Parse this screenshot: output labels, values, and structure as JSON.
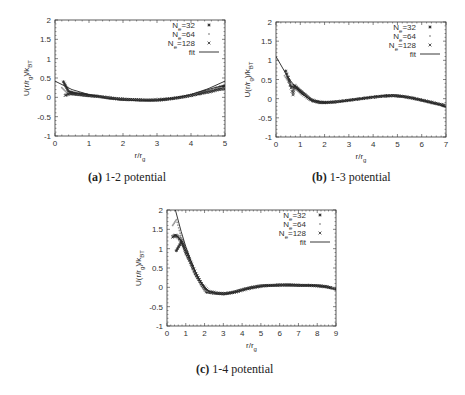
{
  "chart_data": [
    {
      "id": "a",
      "type": "scatter",
      "caption_letter": "(a)",
      "caption_text": "1-2 potential",
      "xlabel": "r/r_g",
      "ylabel": "U(r/r_g)/k_BT",
      "xlim": [
        0,
        5
      ],
      "ylim": [
        -1,
        2
      ],
      "xticks": [
        0,
        1,
        2,
        3,
        4,
        5
      ],
      "yticks": [
        -1,
        -0.5,
        0,
        0.5,
        1,
        1.5,
        2
      ],
      "yticklabels": [
        "-1",
        "-0.5",
        "0",
        "0.5",
        "1",
        "1.5",
        "2"
      ],
      "grid": false,
      "legend_position": "upper right",
      "legend": [
        "N_e=32",
        "N_e=64",
        "N_e=128",
        "fit"
      ],
      "frame": {
        "left": 55,
        "right": 225,
        "top": 20,
        "bottom": 136
      },
      "series": [
        {
          "name": "N_e=32",
          "marker": "*",
          "x": [
            0.25,
            0.4,
            0.6,
            0.8,
            1.0,
            1.3,
            1.6,
            1.9,
            2.2,
            2.5,
            2.8,
            3.1,
            3.4,
            3.7,
            4.0,
            4.2,
            4.4,
            4.6,
            4.8,
            5.0
          ],
          "y": [
            0.4,
            0.15,
            0.1,
            0.08,
            0.05,
            0.02,
            -0.02,
            -0.05,
            -0.06,
            -0.07,
            -0.08,
            -0.07,
            -0.04,
            0.0,
            0.05,
            0.1,
            0.15,
            0.2,
            0.25,
            0.3
          ]
        },
        {
          "name": "N_e=64",
          "marker": ".",
          "x": [
            0.2,
            0.35,
            0.5,
            0.7,
            0.9,
            1.2,
            1.5,
            1.8,
            2.1,
            2.4,
            2.7,
            3.0,
            3.3,
            3.6,
            3.9,
            4.1,
            4.3,
            4.5,
            4.7,
            4.9
          ],
          "y": [
            0.25,
            0.12,
            0.08,
            0.06,
            0.04,
            0.02,
            -0.01,
            -0.04,
            -0.06,
            -0.07,
            -0.07,
            -0.06,
            -0.04,
            -0.01,
            0.03,
            0.08,
            0.12,
            0.17,
            0.22,
            0.25
          ]
        },
        {
          "name": "N_e=128",
          "marker": "x",
          "x": [
            0.3,
            0.45,
            0.6,
            0.8,
            1.0,
            1.2,
            1.5,
            1.8,
            2.1,
            2.4,
            2.7,
            3.0,
            3.3,
            3.6,
            3.9,
            4.2,
            4.4,
            4.6,
            4.8,
            5.0
          ],
          "y": [
            0.05,
            0.1,
            0.08,
            0.06,
            0.04,
            0.03,
            0.0,
            -0.03,
            -0.05,
            -0.06,
            -0.07,
            -0.06,
            -0.04,
            -0.01,
            0.03,
            0.08,
            0.12,
            0.15,
            0.2,
            0.22
          ]
        },
        {
          "name": "fit",
          "marker": "line",
          "x": [
            0,
            0.5,
            1.0,
            1.5,
            2.0,
            2.5,
            3.0,
            3.5,
            4.0,
            4.5,
            5.0
          ],
          "y": [
            0.42,
            0.2,
            0.07,
            -0.02,
            -0.07,
            -0.09,
            -0.07,
            -0.02,
            0.07,
            0.22,
            0.42
          ]
        }
      ]
    },
    {
      "id": "b",
      "type": "scatter",
      "caption_letter": "(b)",
      "caption_text": "1-3 potential",
      "xlabel": "r/r_g",
      "ylabel": "U(r/r_g)/k_BT",
      "xlim": [
        0,
        7
      ],
      "ylim": [
        -1,
        2
      ],
      "xticks": [
        0,
        1,
        2,
        3,
        4,
        5,
        6,
        7
      ],
      "yticks": [
        -1,
        -0.5,
        0,
        0.5,
        1,
        1.5,
        2
      ],
      "yticklabels": [
        "-1",
        "-0.5",
        "0",
        "0.5",
        "1",
        "1.5",
        "2"
      ],
      "grid": false,
      "legend_position": "upper right",
      "legend": [
        "N_e=32",
        "N_e=64",
        "N_e=128",
        "fit"
      ],
      "frame": {
        "left": 276,
        "right": 446,
        "top": 22,
        "bottom": 137
      },
      "series": [
        {
          "name": "N_e=32",
          "marker": "*",
          "x": [
            0.4,
            0.6,
            0.8,
            1.0,
            1.2,
            1.5,
            1.8,
            2.1,
            2.5,
            3.0,
            3.5,
            4.0,
            4.5,
            4.8,
            5.2,
            5.6,
            6.0,
            6.4,
            6.8,
            7.0
          ],
          "y": [
            0.72,
            0.35,
            0.3,
            0.2,
            0.1,
            -0.05,
            -0.1,
            -0.1,
            -0.08,
            -0.04,
            0.0,
            0.04,
            0.07,
            0.08,
            0.06,
            0.02,
            -0.04,
            -0.1,
            -0.16,
            -0.2
          ]
        },
        {
          "name": "N_e=64",
          "marker": ".",
          "x": [
            0.35,
            0.55,
            0.75,
            0.95,
            1.2,
            1.5,
            1.8,
            2.2,
            2.6,
            3.1,
            3.6,
            4.1,
            4.6,
            5.0,
            5.4,
            5.8,
            6.2,
            6.6,
            7.0
          ],
          "y": [
            0.6,
            0.4,
            0.32,
            0.2,
            0.08,
            -0.04,
            -0.09,
            -0.1,
            -0.08,
            -0.04,
            0.0,
            0.05,
            0.08,
            0.07,
            0.04,
            -0.01,
            -0.06,
            -0.13,
            -0.18
          ]
        },
        {
          "name": "N_e=128",
          "marker": "x",
          "x": [
            0.5,
            0.7,
            0.75,
            0.9,
            1.1,
            1.4,
            1.7,
            2.0,
            2.4,
            2.9,
            3.4,
            3.9,
            4.4,
            4.9,
            5.3,
            5.7,
            6.1,
            6.5,
            6.9
          ],
          "y": [
            0.55,
            0.1,
            0.35,
            0.25,
            0.12,
            -0.02,
            -0.08,
            -0.1,
            -0.09,
            -0.05,
            -0.01,
            0.03,
            0.07,
            0.08,
            0.05,
            0.0,
            -0.05,
            -0.11,
            -0.17
          ]
        },
        {
          "name": "fit",
          "marker": "line",
          "x": [
            0,
            0.5,
            1.0,
            1.5,
            2.0,
            2.5,
            3.0,
            3.5,
            4.0,
            4.5,
            5.0,
            5.5,
            6.0,
            6.5,
            7.0
          ],
          "y": [
            1.1,
            0.55,
            0.15,
            -0.05,
            -0.1,
            -0.09,
            -0.05,
            0.0,
            0.05,
            0.08,
            0.07,
            0.03,
            -0.04,
            -0.12,
            -0.2
          ]
        }
      ]
    },
    {
      "id": "c",
      "type": "scatter",
      "caption_letter": "(c)",
      "caption_text": "1-4 potential",
      "xlabel": "r/r_g",
      "ylabel": "U(r/r_g)/k_BT",
      "xlim": [
        0,
        9
      ],
      "ylim": [
        -1,
        2
      ],
      "xticks": [
        0,
        1,
        2,
        3,
        4,
        5,
        6,
        7,
        8,
        9
      ],
      "yticks": [
        -1,
        -0.5,
        0,
        0.5,
        1,
        1.5,
        2
      ],
      "yticklabels": [
        "-1",
        "-0.5",
        "0",
        "0.5",
        "1",
        "1.5",
        "2"
      ],
      "grid": false,
      "legend_position": "upper right",
      "legend": [
        "N_e=32",
        "N_e=64",
        "N_e=128",
        "fit"
      ],
      "frame": {
        "left": 167,
        "right": 336,
        "top": 210,
        "bottom": 326
      },
      "series": [
        {
          "name": "N_e=32",
          "marker": "*",
          "x": [
            0.5,
            0.8,
            1.0,
            1.2,
            1.5,
            1.8,
            2.1,
            2.5,
            3.0,
            3.5,
            4.0,
            4.5,
            5.0,
            5.5,
            6.0,
            6.5,
            7.0,
            7.5,
            8.0,
            8.5,
            9.0
          ],
          "y": [
            0.95,
            1.2,
            0.9,
            0.7,
            0.35,
            0.1,
            -0.12,
            -0.15,
            -0.17,
            -0.13,
            -0.06,
            0.0,
            0.04,
            0.05,
            0.06,
            0.06,
            0.05,
            0.05,
            0.04,
            0.02,
            -0.05
          ]
        },
        {
          "name": "N_e=64",
          "marker": ".",
          "x": [
            0.3,
            0.5,
            0.7,
            0.9,
            1.1,
            1.4,
            1.7,
            2.0,
            2.4,
            2.9,
            3.4,
            3.9,
            4.4,
            4.9,
            5.4,
            5.9,
            6.4,
            6.9,
            7.4,
            7.9,
            8.4,
            8.9
          ],
          "y": [
            1.6,
            1.75,
            1.4,
            1.1,
            0.8,
            0.45,
            0.15,
            -0.08,
            -0.14,
            -0.17,
            -0.15,
            -0.08,
            -0.02,
            0.03,
            0.05,
            0.06,
            0.06,
            0.05,
            0.05,
            0.04,
            0.02,
            -0.03
          ]
        },
        {
          "name": "N_e=128",
          "marker": "x",
          "x": [
            0.3,
            0.45,
            0.6,
            0.75,
            0.9,
            1.1,
            1.3,
            1.6,
            1.9,
            2.2,
            2.7,
            3.2,
            3.7,
            4.2,
            4.7,
            5.2,
            5.7,
            6.2,
            6.7,
            7.2,
            7.7,
            8.2,
            8.7
          ],
          "y": [
            1.3,
            1.35,
            1.3,
            1.2,
            1.05,
            0.85,
            0.6,
            0.3,
            0.05,
            -0.1,
            -0.15,
            -0.16,
            -0.12,
            -0.05,
            0.0,
            0.04,
            0.05,
            0.06,
            0.06,
            0.05,
            0.05,
            0.03,
            -0.01
          ]
        },
        {
          "name": "fit",
          "marker": "line",
          "x": [
            0.45,
            0.75,
            1.0,
            1.25,
            1.5,
            1.75,
            2.0,
            2.3,
            2.7,
            3.0,
            3.5,
            4.0,
            4.5,
            5.0,
            5.5,
            6.0,
            6.5,
            7.0,
            7.5,
            8.0,
            8.5,
            9.0
          ],
          "y": [
            2.0,
            1.45,
            1.05,
            0.72,
            0.42,
            0.18,
            0.0,
            -0.12,
            -0.17,
            -0.18,
            -0.14,
            -0.07,
            -0.01,
            0.03,
            0.05,
            0.06,
            0.06,
            0.06,
            0.05,
            0.04,
            0.01,
            -0.05
          ]
        }
      ]
    }
  ],
  "captions": {
    "a": {
      "letter": "(a)",
      "text": "1-2 potential"
    },
    "b": {
      "letter": "(b)",
      "text": "1-3 potential"
    },
    "c": {
      "letter": "(c)",
      "text": "1-4 potential"
    }
  },
  "colors": {
    "axis": "#333333",
    "marker": "#2a2a2a",
    "marker_light": "#9a9a9a",
    "fit": "#222222"
  }
}
